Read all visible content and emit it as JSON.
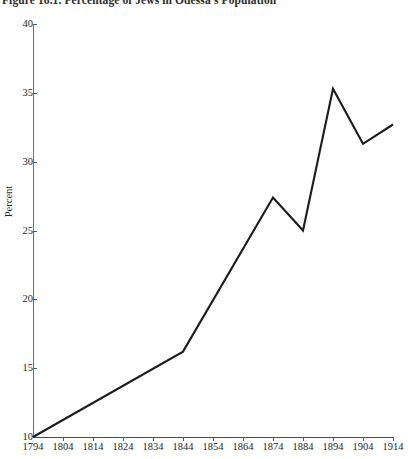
{
  "figure": {
    "caption": "Figure 16.1. Percentage of Jews in Odessa's Population"
  },
  "axes": {
    "y_title": "Percent",
    "y_ticks": [
      "40",
      "35",
      "30",
      "25",
      "20",
      "15",
      "10"
    ],
    "x_ticks": [
      "1794",
      "1804",
      "1814",
      "1824",
      "1834",
      "1844",
      "1854",
      "1864",
      "1874",
      "1884",
      "1894",
      "1904",
      "1914"
    ]
  },
  "style": {
    "line_color": "#1c1c1c",
    "axis_color": "#5a5a5a",
    "background": "#ffffff"
  },
  "chart_data": {
    "type": "line",
    "title": "Figure 16.1. Percentage of Jews in Odessa's Population",
    "xlabel": "",
    "ylabel": "Percent",
    "xlim": [
      1794,
      1914
    ],
    "ylim": [
      10,
      40
    ],
    "grid": false,
    "legend": "none",
    "x_tick_values": [
      1794,
      1804,
      1814,
      1824,
      1834,
      1844,
      1854,
      1864,
      1874,
      1884,
      1894,
      1904,
      1914
    ],
    "y_tick_values": [
      10,
      15,
      20,
      25,
      30,
      35,
      40
    ],
    "x": [
      1794,
      1844,
      1874,
      1884,
      1894,
      1904,
      1914
    ],
    "y": [
      10.0,
      16.2,
      27.4,
      25.0,
      35.3,
      31.3,
      32.7
    ],
    "series": [
      {
        "name": "Percentage of Jews in Odessa's Population",
        "points": [
          {
            "x": 1794,
            "y": 10.0
          },
          {
            "x": 1844,
            "y": 16.2
          },
          {
            "x": 1874,
            "y": 27.4
          },
          {
            "x": 1884,
            "y": 25.0
          },
          {
            "x": 1894,
            "y": 35.3
          },
          {
            "x": 1904,
            "y": 31.3
          },
          {
            "x": 1914,
            "y": 32.7
          }
        ]
      }
    ]
  }
}
